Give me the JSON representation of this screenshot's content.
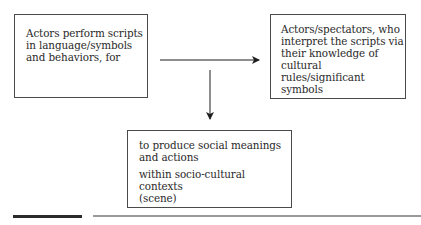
{
  "diagram": {
    "type": "flow",
    "nodes": [
      {
        "id": "actors",
        "lines": [
          "Actors perform scripts",
          "in language/symbols",
          "and behaviors, for"
        ]
      },
      {
        "id": "spectators",
        "lines": [
          "Actors/spectators, who",
          "interpret the scripts via",
          "their knowledge of",
          "cultural rules/significant",
          "symbols"
        ]
      },
      {
        "id": "meanings",
        "paragraphs": [
          [
            "to produce social meanings",
            "and actions"
          ],
          [
            "within socio-cultural contexts",
            "(scene)"
          ]
        ]
      }
    ],
    "edges": [
      {
        "from": "actors",
        "to": "spectators",
        "direction": "right"
      },
      {
        "from": "actors-spectators-link",
        "to": "meanings",
        "direction": "down"
      }
    ],
    "colors": {
      "border": "#4a4a4a",
      "arrow": "#1e1e1e",
      "text": "#2a2a2a",
      "rule_thick": "#2b2b2b",
      "rule_thin": "#9a9a9a"
    }
  }
}
